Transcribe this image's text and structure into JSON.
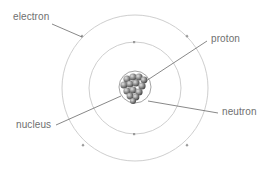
{
  "labels": {
    "electron": "electron",
    "proton": "proton",
    "nucleus": "nucleus",
    "neutron": "neutron"
  },
  "colors": {
    "orbit": "#c4c4c4",
    "leader": "#6a6a6a",
    "label": "#6f6f6f",
    "particle": "#8a8a8a"
  }
}
